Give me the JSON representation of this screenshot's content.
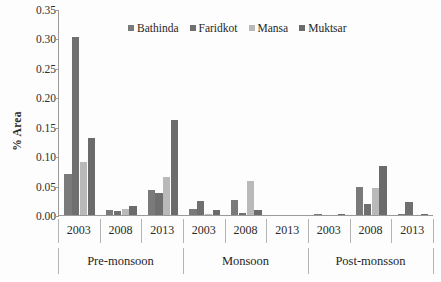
{
  "chart_data": {
    "type": "bar",
    "title": "",
    "subtitle": "",
    "xlabel": "",
    "ylabel": "% Area",
    "ylim": [
      0.0,
      0.35
    ],
    "grid": false,
    "legend_position": "top-center",
    "y_ticks": [
      "0.00",
      "0.05",
      "0.10",
      "0.15",
      "0.20",
      "0.25",
      "0.30",
      "0.35"
    ],
    "y_tick_values": [
      0.0,
      0.05,
      0.1,
      0.15,
      0.2,
      0.25,
      0.3,
      0.35
    ],
    "groups": [
      "Pre-monsoon",
      "Monsoon",
      "Post-monsson"
    ],
    "categories": [
      "2003",
      "2008",
      "2013",
      "2003",
      "2008",
      "2013",
      "2003",
      "2008",
      "2013"
    ],
    "group_spans": [
      {
        "label": "Pre-monsoon",
        "years": [
          "2003",
          "2008",
          "2013"
        ]
      },
      {
        "label": "Monsoon",
        "years": [
          "2003",
          "2008",
          "2013"
        ]
      },
      {
        "label": "Post-monsson",
        "years": [
          "2003",
          "2008",
          "2013"
        ]
      }
    ],
    "series": [
      {
        "name": "Bathinda",
        "color": "#7a7a7a",
        "values": [
          0.069,
          0.008,
          0.042,
          0.01,
          0.026,
          0.0,
          0.001,
          0.047,
          0.001
        ]
      },
      {
        "name": "Faridkot",
        "color": "#6f6f6f",
        "values": [
          0.302,
          0.006,
          0.038,
          0.024,
          0.004,
          0.0,
          0.0,
          0.019,
          0.022
        ]
      },
      {
        "name": "Mansa",
        "color": "#b9b9b9",
        "values": [
          0.09,
          0.01,
          0.065,
          0.002,
          0.057,
          0.0,
          0.0,
          0.046,
          0.0
        ]
      },
      {
        "name": "Muktsar",
        "color": "#6b6b6b",
        "values": [
          0.131,
          0.015,
          0.161,
          0.008,
          0.008,
          0.0,
          0.001,
          0.083,
          0.001
        ]
      }
    ]
  },
  "legend": {
    "items": [
      {
        "label": "Bathinda",
        "color": "#7a7a7a"
      },
      {
        "label": "Faridkot",
        "color": "#6f6f6f"
      },
      {
        "label": "Mansa",
        "color": "#b9b9b9"
      },
      {
        "label": "Muktsar",
        "color": "#6b6b6b"
      }
    ]
  },
  "axes": {
    "y_title": "% Area",
    "axis_color": "#9a9a9a"
  }
}
